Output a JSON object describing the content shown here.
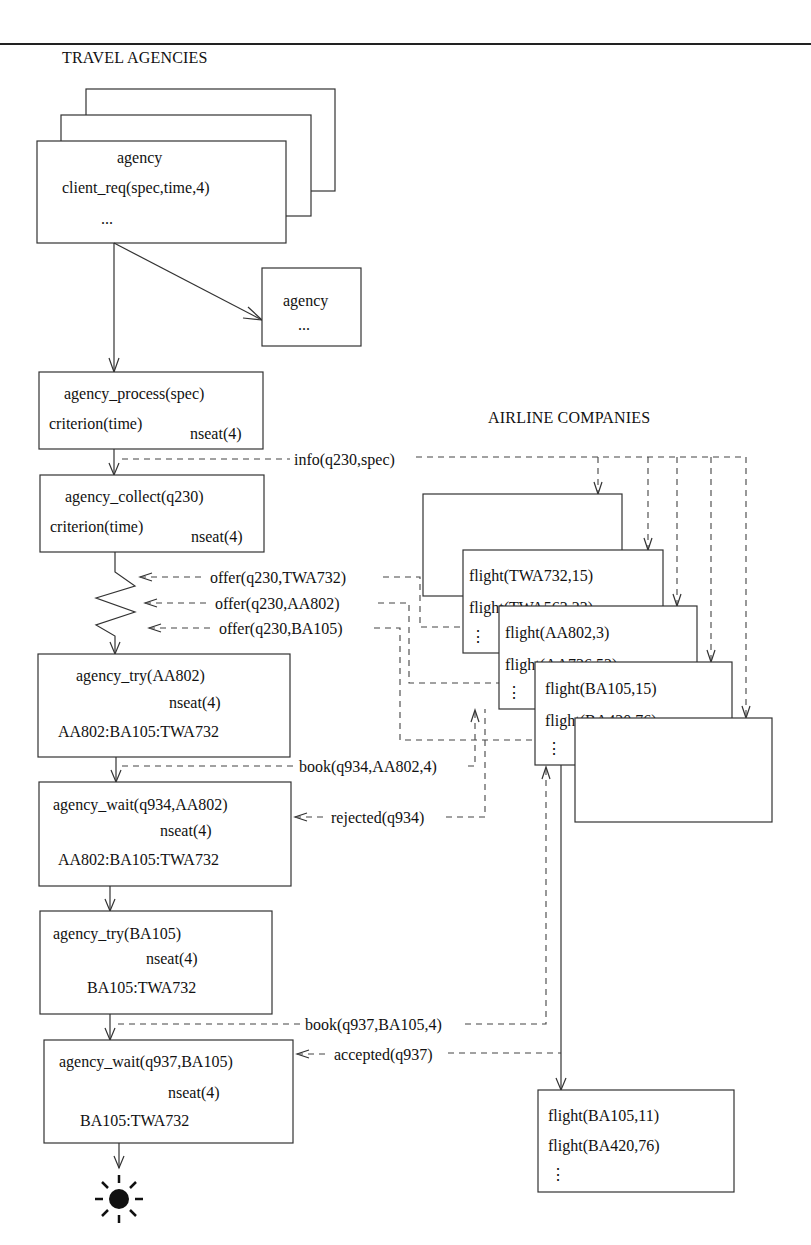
{
  "headings": {
    "travel_agencies": "TRAVEL AGENCIES",
    "airline_companies": "AIRLINE COMPANIES"
  },
  "agency_stack": {
    "title": "agency",
    "line": "client_req(spec,time,4)",
    "ellipsis": "..."
  },
  "agency_small": {
    "title": "agency",
    "ellipsis": "..."
  },
  "states": [
    {
      "name": "agency_process(spec)",
      "left": "criterion(time)",
      "right": "nseat(4)"
    },
    {
      "name": "agency_collect(q230)",
      "left": "criterion(time)",
      "right": "nseat(4)"
    },
    {
      "name": "agency_try(AA802)",
      "right": "nseat(4)",
      "list": "AA802:BA105:TWA732"
    },
    {
      "name": "agency_wait(q934,AA802)",
      "right": "nseat(4)",
      "list": "AA802:BA105:TWA732"
    },
    {
      "name": "agency_try(BA105)",
      "right": "nseat(4)",
      "list": "BA105:TWA732"
    },
    {
      "name": "agency_wait(q937,BA105)",
      "right": "nseat(4)",
      "list": "BA105:TWA732"
    }
  ],
  "messages": {
    "info": "info(q230,spec)",
    "offer_twa": "offer(q230,TWA732)",
    "offer_aa": "offer(q230,AA802)",
    "offer_ba": "offer(q230,BA105)",
    "book_aa": "book(q934,AA802,4)",
    "rejected": "rejected(q934)",
    "book_ba": "book(q937,BA105,4)",
    "accepted": "accepted(q937)"
  },
  "airlines": {
    "twa": [
      "flight(TWA732,15)",
      "flight(TWA563,23)",
      "⋮"
    ],
    "aa": [
      "flight(AA802,3)",
      "flight(AA736,52)",
      "⋮"
    ],
    "ba": [
      "flight(BA105,15)",
      "flight(BA420,76)",
      "⋮"
    ],
    "ba_after": [
      "flight(BA105,11)",
      "flight(BA420,76)",
      "⋮"
    ]
  },
  "end_symbol": "terminal-sun"
}
